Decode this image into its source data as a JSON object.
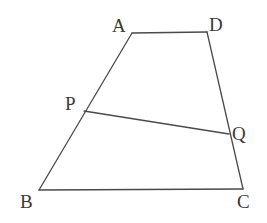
{
  "figure": {
    "kind": "geometry-diagram",
    "background_color": "#ffffff",
    "stroke_color": "#4a4a4a",
    "label_color": "#3a3a3a",
    "stroke_width": 1.3,
    "width": 267,
    "height": 223
  },
  "points": {
    "A": {
      "label": "A",
      "x": 132,
      "y": 33,
      "label_x": 112,
      "label_y": 16
    },
    "D": {
      "label": "D",
      "x": 207,
      "y": 32,
      "label_x": 209,
      "label_y": 15
    },
    "B": {
      "label": "B",
      "x": 39,
      "y": 190,
      "label_x": 20,
      "label_y": 192
    },
    "C": {
      "label": "C",
      "x": 243,
      "y": 189,
      "label_x": 237,
      "label_y": 192
    },
    "P": {
      "label": "P",
      "x": 84,
      "y": 111,
      "label_x": 65,
      "label_y": 94
    },
    "Q": {
      "label": "Q",
      "x": 229,
      "y": 134,
      "label_x": 232,
      "label_y": 124
    }
  },
  "segments": [
    {
      "name": "segment-AD",
      "from": "A",
      "to": "D"
    },
    {
      "name": "segment-AB",
      "from": "A",
      "to": "B"
    },
    {
      "name": "segment-BC",
      "from": "B",
      "to": "C"
    },
    {
      "name": "segment-DC",
      "from": "D",
      "to": "C"
    },
    {
      "name": "segment-PQ",
      "from": "P",
      "to": "Q"
    }
  ],
  "polyline_path": "M132,33 L207,32 L243,189 L39,190 Z",
  "transversal_path": "M84,111 L229,134"
}
